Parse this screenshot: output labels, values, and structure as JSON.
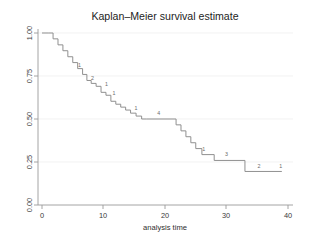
{
  "chart_data": {
    "type": "line",
    "title": "Kaplan–Meier survival estimate",
    "xlabel": "analysis time",
    "ylabel": "",
    "xlim": [
      0,
      40
    ],
    "ylim": [
      0,
      1.0
    ],
    "grid": true,
    "legend": "none",
    "xticks": [
      0,
      10,
      20,
      30,
      40
    ],
    "xtick_labels": [
      "0",
      "10",
      "20",
      "30",
      "40"
    ],
    "yticks": [
      0.0,
      0.25,
      0.5,
      0.75,
      1.0
    ],
    "ytick_labels": [
      "0.00",
      "0.25",
      "0.50",
      "0.75",
      "1.00"
    ],
    "series": [
      {
        "name": "survival estimate",
        "step": "post",
        "x": [
          0.0,
          1.0,
          1.8,
          2.6,
          3.4,
          4.2,
          5.0,
          5.8,
          6.6,
          7.3,
          8.0,
          8.8,
          9.6,
          10.4,
          11.2,
          12.0,
          12.8,
          13.6,
          14.4,
          15.3,
          16.2,
          17.0,
          21.8,
          22.6,
          23.4,
          24.2,
          25.0,
          26.0,
          28.0,
          33.0,
          39.0
        ],
        "y": [
          1.0,
          1.0,
          0.966,
          0.931,
          0.897,
          0.862,
          0.828,
          0.793,
          0.759,
          0.724,
          0.707,
          0.69,
          0.655,
          0.638,
          0.603,
          0.586,
          0.569,
          0.552,
          0.534,
          0.517,
          0.5,
          0.5,
          0.466,
          0.431,
          0.397,
          0.362,
          0.328,
          0.293,
          0.259,
          0.195,
          0.195
        ]
      }
    ],
    "annotations": [
      {
        "label": "1",
        "x": 6.1,
        "y": 0.8
      },
      {
        "label": "2",
        "x": 8.2,
        "y": 0.727
      },
      {
        "label": "1",
        "x": 10.5,
        "y": 0.693
      },
      {
        "label": "1",
        "x": 11.7,
        "y": 0.641
      },
      {
        "label": "1",
        "x": 15.3,
        "y": 0.555
      },
      {
        "label": "4",
        "x": 19.0,
        "y": 0.525
      },
      {
        "label": "1",
        "x": 26.3,
        "y": 0.315
      },
      {
        "label": "3",
        "x": 30.0,
        "y": 0.283
      },
      {
        "label": "2",
        "x": 35.3,
        "y": 0.218
      },
      {
        "label": "1",
        "x": 38.8,
        "y": 0.218
      }
    ]
  },
  "colors": {
    "curve": "#8a8a8a",
    "axis": "#9a9a9a",
    "grid": "#ececec",
    "text": "#2e2e2e",
    "background": "#ffffff"
  }
}
